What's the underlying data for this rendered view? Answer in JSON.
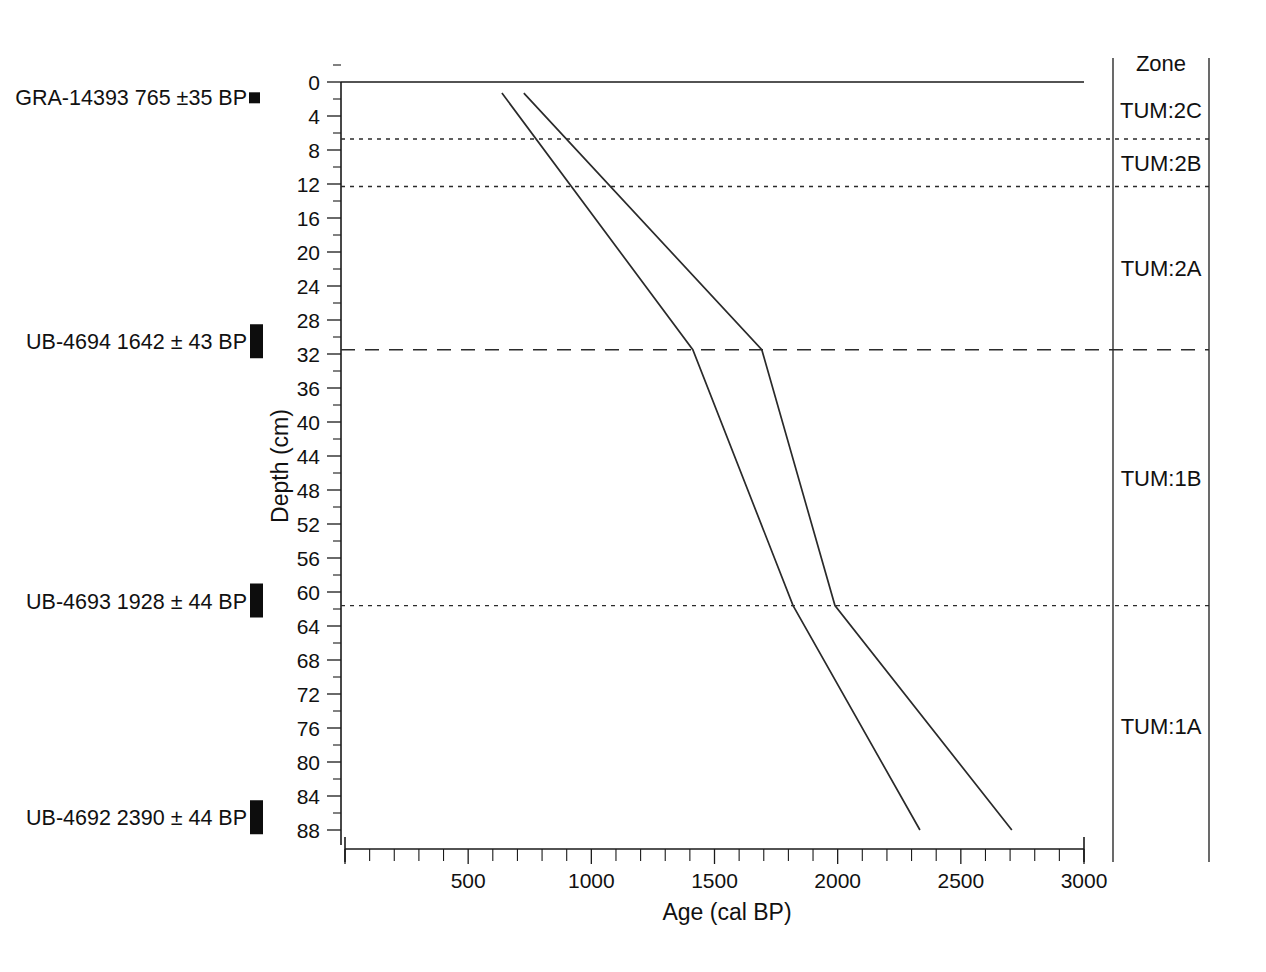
{
  "figure": {
    "background_color": "#ffffff",
    "line_color": "#2a2a2a"
  },
  "chart_data": {
    "type": "line",
    "title": "",
    "xlabel": "Age (cal BP)",
    "ylabel": "Depth (cm)",
    "xlim": [
      0,
      3000
    ],
    "ylim": [
      0,
      90
    ],
    "y_inverted": true,
    "grid": false,
    "legend": "none",
    "x_ticks_major": [
      0,
      500,
      1000,
      1500,
      2000,
      2500,
      3000
    ],
    "x_tick_labels": [
      "",
      "500",
      "1000",
      "1500",
      "2000",
      "2500",
      "3000"
    ],
    "x_tick_minor_step": 100,
    "y_ticks": [
      0,
      4,
      8,
      12,
      16,
      20,
      24,
      28,
      32,
      36,
      40,
      44,
      48,
      52,
      56,
      60,
      64,
      68,
      72,
      76,
      80,
      84,
      88
    ],
    "y_tick_labels": [
      "0",
      "4",
      "8",
      "12",
      "16",
      "20",
      "24",
      "28",
      "32",
      "36",
      "40",
      "44",
      "48",
      "52",
      "56",
      "60",
      "64",
      "68",
      "72",
      "76",
      "80",
      "84",
      "88"
    ],
    "series": [
      {
        "name": "lower-age-bound",
        "points": [
          {
            "age": 637,
            "depth": 1.3
          },
          {
            "age": 1412,
            "depth": 31.5
          },
          {
            "age": 1819,
            "depth": 61.6
          },
          {
            "age": 2334,
            "depth": 88.0
          }
        ]
      },
      {
        "name": "upper-age-bound",
        "points": [
          {
            "age": 726,
            "depth": 1.3
          },
          {
            "age": 1692,
            "depth": 31.5
          },
          {
            "age": 1989,
            "depth": 61.6
          },
          {
            "age": 2707,
            "depth": 88.0
          }
        ]
      }
    ],
    "zone_boundaries_depth": [
      6.7,
      12.3,
      31.5,
      61.6
    ],
    "annotations": [
      {
        "label": "GRA-14393 765 ±35 BP",
        "depth": 1.8,
        "marker": "small-square"
      },
      {
        "label": "UB-4694 1642 ± 43 BP",
        "depth": 30.5,
        "marker": "tall-bar"
      },
      {
        "label": "UB-4693 1928 ± 44 BP",
        "depth": 61.0,
        "marker": "tall-bar"
      },
      {
        "label": "UB-4692 2390 ± 44 BP",
        "depth": 86.5,
        "marker": "tall-bar"
      }
    ]
  },
  "zone_panel": {
    "header": "Zone",
    "zones": [
      {
        "label": "TUM:2C",
        "top_depth": 0.0,
        "bottom_depth": 6.7
      },
      {
        "label": "TUM:2B",
        "top_depth": 6.7,
        "bottom_depth": 12.3
      },
      {
        "label": "TUM:2A",
        "top_depth": 12.3,
        "bottom_depth": 31.5
      },
      {
        "label": "TUM:1B",
        "top_depth": 31.5,
        "bottom_depth": 61.6
      },
      {
        "label": "TUM:1A",
        "top_depth": 61.6,
        "bottom_depth": 90.0
      }
    ]
  },
  "radiocarbon_dates": [
    {
      "lab_code": "GRA-14393",
      "age_bp": "765 ±35 BP",
      "full_label": "GRA-14393 765 ±35 BP"
    },
    {
      "lab_code": "UB-4694",
      "age_bp": "1642 ± 43 BP",
      "full_label": "UB-4694 1642 ± 43 BP"
    },
    {
      "lab_code": "UB-4693",
      "age_bp": "1928 ± 44 BP",
      "full_label": "UB-4693 1928 ± 44 BP"
    },
    {
      "lab_code": "UB-4692",
      "age_bp": "2390 ± 44 BP",
      "full_label": "UB-4692 2390 ± 44 BP"
    }
  ]
}
